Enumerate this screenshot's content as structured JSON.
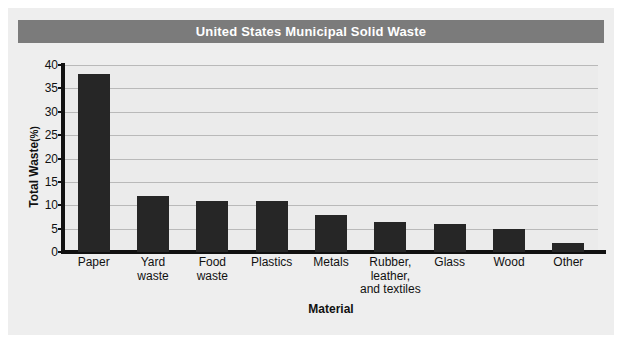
{
  "chart_data": {
    "type": "bar",
    "title": "United States Municipal Solid Waste",
    "xlabel": "Material",
    "ylabel": "Total Waste",
    "yunit": "(%)",
    "categories": [
      "Paper",
      "Yard waste",
      "Food waste",
      "Plastics",
      "Metals",
      "Rubber, leather, and textiles",
      "Glass",
      "Wood",
      "Other"
    ],
    "category_lines": [
      [
        "Paper"
      ],
      [
        "Yard",
        "waste"
      ],
      [
        "Food",
        "waste"
      ],
      [
        "Plastics"
      ],
      [
        "Metals"
      ],
      [
        "Rubber,",
        "leather,",
        "and textiles"
      ],
      [
        "Glass"
      ],
      [
        "Wood"
      ],
      [
        "Other"
      ]
    ],
    "values": [
      38,
      12,
      11,
      11,
      8,
      6.5,
      6,
      5,
      2
    ],
    "ylim": [
      0,
      40
    ],
    "yticks": [
      0,
      5,
      10,
      15,
      20,
      25,
      30,
      35,
      40
    ],
    "ytick_labels": [
      "0",
      "5",
      "10",
      "15",
      "20",
      "25",
      "30",
      "35",
      "40"
    ],
    "grid": true,
    "legend": "none",
    "bar_color": "#262626",
    "plot_background": "#ebebeb",
    "title_background": "#7b7b7b",
    "title_color": "#ffffff"
  }
}
